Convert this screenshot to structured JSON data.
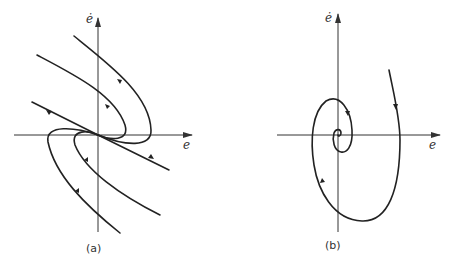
{
  "figure": {
    "panels": [
      {
        "id": "a",
        "caption": "(a)",
        "x_axis_label": "e",
        "y_axis_label": "ė",
        "type": "stable node phase portrait"
      },
      {
        "id": "b",
        "caption": "(b)",
        "x_axis_label": "e",
        "y_axis_label": "ė",
        "type": "stable focus (spiral) phase portrait"
      }
    ]
  },
  "colors": {
    "line": "#222222",
    "axis": "#333333",
    "background": "#ffffff"
  }
}
